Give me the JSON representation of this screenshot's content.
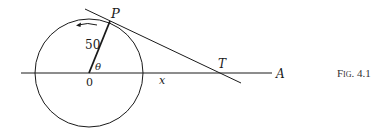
{
  "figure": {
    "caption": "Fig. 4.1",
    "labels": {
      "point_p": "P",
      "radius": "50",
      "angle": "θ",
      "origin": "0",
      "distance": "x",
      "point_t": "T",
      "point_a": "A"
    },
    "colors": {
      "stroke": "#1a1a1a",
      "background": "#ffffff"
    }
  }
}
